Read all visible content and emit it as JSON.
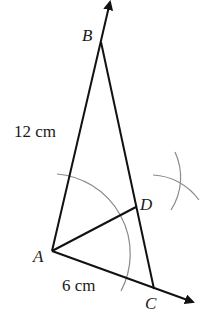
{
  "diagram": {
    "type": "geometric-construction",
    "points": {
      "A": {
        "label": "A",
        "x": 52,
        "y": 251
      },
      "B": {
        "label": "B",
        "x": 101,
        "y": 42
      },
      "C": {
        "label": "C",
        "x": 154,
        "y": 289
      },
      "D": {
        "label": "D",
        "x": 136,
        "y": 207
      }
    },
    "measurements": {
      "AB": "12 cm",
      "AC": "6 cm"
    },
    "colors": {
      "line": "#111111",
      "construction_arc": "#8a8a8a"
    }
  }
}
